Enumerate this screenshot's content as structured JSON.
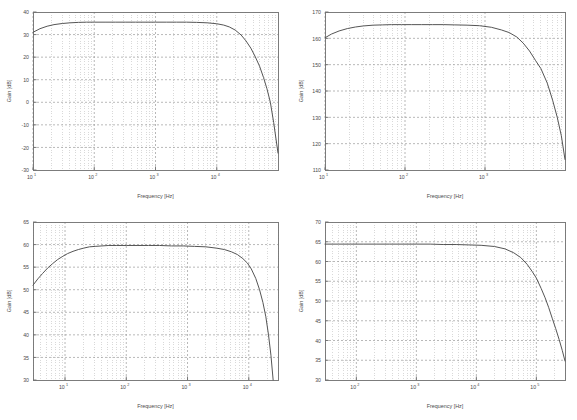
{
  "figure": {
    "title": "",
    "background": "#ffffff",
    "layout": "2x2 grid of Bode magnitude plots",
    "line_color": "#555555",
    "grid_color": "#b4b4b4",
    "axis_color": "#6e6e6e",
    "tick_label_color": "#4a4a4a"
  },
  "chart_data": [
    {
      "id": "amplifier-gain-plot-1",
      "position": "top-left",
      "type": "line",
      "title": "",
      "xlabel": "Frequency [Hz]",
      "ylabel": "Gain [dB]",
      "xscale": "log",
      "yscale": "linear",
      "xlim": [
        10,
        100000
      ],
      "ylim": [
        -30,
        40
      ],
      "yticks": [
        40,
        30,
        20,
        10,
        0,
        -10,
        -20,
        -30
      ],
      "ytick_labels": [
        "40",
        "30",
        "20",
        "10",
        "0",
        "-10",
        "-20",
        "-30"
      ],
      "xticks": [
        10,
        100,
        1000,
        10000
      ],
      "xtick_labels": [
        "10^1",
        "10^2",
        "10^3",
        "10^4"
      ],
      "xtick_mantissa": [
        "10",
        "10",
        "10",
        "10"
      ],
      "xtick_exponent": [
        "1",
        "2",
        "3",
        "4"
      ],
      "grid": true,
      "minor_grid": true,
      "legend": null,
      "series": [
        {
          "name": "Gain",
          "x": [
            10,
            13,
            17,
            22,
            30,
            40,
            55,
            75,
            100,
            150,
            220,
            320,
            470,
            700,
            1000,
            1500,
            2200,
            3200,
            4700,
            7000,
            10000,
            13000,
            16000,
            20000,
            25000,
            30000,
            36000,
            42000,
            50000,
            58000,
            66000,
            75000,
            85000,
            100000
          ],
          "y": [
            31.0,
            32.6,
            33.7,
            34.4,
            34.9,
            35.2,
            35.4,
            35.5,
            35.5,
            35.5,
            35.5,
            35.5,
            35.5,
            35.5,
            35.5,
            35.5,
            35.5,
            35.5,
            35.4,
            35.2,
            34.8,
            34.2,
            33.4,
            32.0,
            29.8,
            27.2,
            24.0,
            20.5,
            16.0,
            11.0,
            6.0,
            0.0,
            -9.0,
            -22.5
          ]
        }
      ]
    },
    {
      "id": "amplifier-gain-plot-2",
      "position": "top-right",
      "type": "line",
      "title": "",
      "xlabel": "Frequency [Hz]",
      "ylabel": "Gain [dB]",
      "xscale": "log",
      "yscale": "linear",
      "xlim": [
        10,
        10000
      ],
      "ylim": [
        110,
        170
      ],
      "yticks": [
        170,
        160,
        150,
        140,
        130,
        120,
        110
      ],
      "ytick_labels": [
        "170",
        "160",
        "150",
        "140",
        "130",
        "120",
        "110"
      ],
      "xticks": [
        10,
        100,
        1000
      ],
      "xtick_labels": [
        "10^1",
        "10^2",
        "10^3"
      ],
      "xtick_mantissa": [
        "10",
        "10",
        "10"
      ],
      "xtick_exponent": [
        "1",
        "2",
        "3"
      ],
      "grid": true,
      "minor_grid": true,
      "legend": null,
      "series": [
        {
          "name": "Gain",
          "x": [
            10,
            12,
            15,
            19,
            24,
            30,
            40,
            52,
            68,
            90,
            120,
            160,
            220,
            300,
            420,
            600,
            850,
            1200,
            1600,
            2000,
            2500,
            3000,
            3600,
            4300,
            5000,
            6000,
            7000,
            8000,
            9000,
            10000
          ],
          "y": [
            160.2,
            161.6,
            162.8,
            163.7,
            164.3,
            164.7,
            165.0,
            165.1,
            165.2,
            165.2,
            165.2,
            165.2,
            165.2,
            165.2,
            165.1,
            165.0,
            164.8,
            164.2,
            163.2,
            162.2,
            160.5,
            158.2,
            155.2,
            151.5,
            148.5,
            143.0,
            136.5,
            130.0,
            123.0,
            114.0
          ]
        }
      ]
    },
    {
      "id": "amplifier-gain-plot-3",
      "position": "bottom-left",
      "type": "line",
      "title": "",
      "xlabel": "Frequency [Hz]",
      "ylabel": "Gain [dB]",
      "xscale": "log",
      "yscale": "linear",
      "xlim": [
        3,
        30000
      ],
      "ylim": [
        30,
        65
      ],
      "yticks": [
        65,
        60,
        55,
        50,
        45,
        40,
        35,
        30
      ],
      "ytick_labels": [
        "65",
        "60",
        "55",
        "50",
        "45",
        "40",
        "35",
        "30"
      ],
      "xticks": [
        10,
        100,
        1000,
        10000
      ],
      "xtick_labels": [
        "10^1",
        "10^2",
        "10^3",
        "10^4"
      ],
      "xtick_mantissa": [
        "10",
        "10",
        "10",
        "10"
      ],
      "xtick_exponent": [
        "1",
        "2",
        "3",
        "4"
      ],
      "grid": true,
      "minor_grid": true,
      "legend": null,
      "series": [
        {
          "name": "Gain",
          "x": [
            3,
            3.6,
            4.3,
            5.2,
            6.3,
            7.6,
            9.2,
            11,
            13.5,
            16.5,
            20,
            25,
            31,
            40,
            52,
            70,
            100,
            150,
            230,
            350,
            550,
            850,
            1300,
            2000,
            3000,
            4000,
            5200,
            6500,
            8000,
            9500,
            11000,
            13000,
            15000,
            17000,
            19000,
            21000,
            23000,
            25000
          ],
          "y": [
            51.0,
            52.4,
            53.6,
            54.8,
            55.8,
            56.7,
            57.4,
            58.0,
            58.5,
            58.9,
            59.2,
            59.5,
            59.6,
            59.7,
            59.8,
            59.8,
            59.8,
            59.8,
            59.8,
            59.8,
            59.7,
            59.7,
            59.6,
            59.5,
            59.2,
            58.9,
            58.4,
            57.8,
            56.9,
            55.9,
            54.6,
            52.5,
            50.0,
            47.2,
            44.0,
            40.0,
            35.5,
            30.0
          ]
        }
      ]
    },
    {
      "id": "amplifier-gain-plot-4",
      "position": "bottom-right",
      "type": "line",
      "title": "",
      "xlabel": "Frequency [Hz]",
      "ylabel": "Gain [dB]",
      "xscale": "log",
      "yscale": "linear",
      "xlim": [
        30,
        300000
      ],
      "ylim": [
        30,
        70
      ],
      "yticks": [
        70,
        65,
        60,
        55,
        50,
        45,
        40,
        35,
        30
      ],
      "ytick_labels": [
        "70",
        "65",
        "60",
        "55",
        "50",
        "45",
        "40",
        "35",
        "30"
      ],
      "xticks": [
        100,
        1000,
        10000,
        100000
      ],
      "xtick_labels": [
        "10^2",
        "10^3",
        "10^4",
        "10^5"
      ],
      "xtick_mantissa": [
        "10",
        "10",
        "10",
        "10"
      ],
      "xtick_exponent": [
        "2",
        "3",
        "4",
        "5"
      ],
      "grid": true,
      "minor_grid": true,
      "legend": null,
      "series": [
        {
          "name": "Gain",
          "x": [
            30,
            50,
            80,
            130,
            220,
            360,
            600,
            1000,
            1700,
            2800,
            4600,
            7500,
            12000,
            20000,
            30000,
            42000,
            55000,
            70000,
            85000,
            100000,
            120000,
            140000,
            160000,
            185000,
            210000,
            240000,
            270000,
            300000
          ],
          "y": [
            64.4,
            64.4,
            64.4,
            64.4,
            64.4,
            64.4,
            64.4,
            64.4,
            64.4,
            64.3,
            64.3,
            64.2,
            64.1,
            63.8,
            63.2,
            62.2,
            61.0,
            59.3,
            57.5,
            55.8,
            53.2,
            50.8,
            48.4,
            45.5,
            43.0,
            40.2,
            37.5,
            34.8
          ]
        }
      ]
    }
  ]
}
